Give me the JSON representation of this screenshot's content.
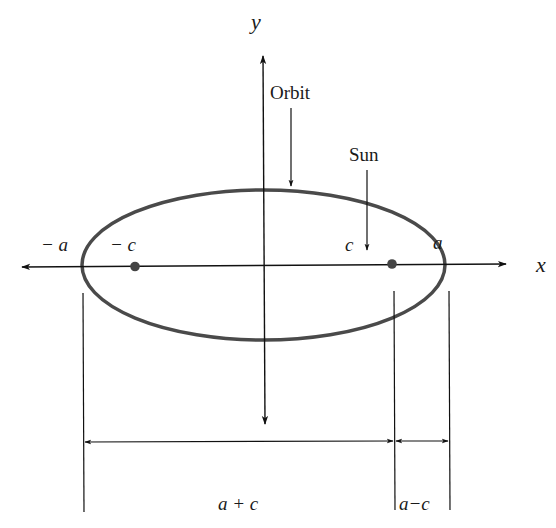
{
  "diagram": {
    "axes": {
      "x_label": "x",
      "y_label": "y"
    },
    "labels": {
      "orbit": "Orbit",
      "sun": "Sun",
      "neg_a": "− a",
      "neg_c": "− c",
      "c": "c",
      "a": "a",
      "a_plus_c": "a + c",
      "a_minus_c": "a−c"
    },
    "colors": {
      "ellipse": "#4a4a4a",
      "axis": "#111111",
      "focus": "#444444"
    }
  }
}
